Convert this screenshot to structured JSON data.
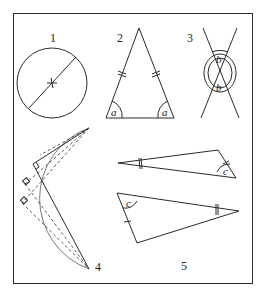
{
  "figure": {
    "panels": [
      {
        "id": "1",
        "label": "1",
        "description": "circle with diameter through center"
      },
      {
        "id": "2",
        "label": "2",
        "description": "isosceles triangle with equal base angles",
        "angle_label_left": "a",
        "angle_label_right": "a"
      },
      {
        "id": "3",
        "label": "3",
        "description": "vertical angles formed by intersecting lines",
        "angle_label_top": "b",
        "angle_label_bottom": "b"
      },
      {
        "id": "4",
        "label": "4",
        "description": "right angles inscribed in a semicircle"
      },
      {
        "id": "5",
        "label": "5",
        "description": "congruent triangles (ASA)",
        "angle_label_top": "c",
        "angle_label_bottom": "c"
      }
    ]
  }
}
